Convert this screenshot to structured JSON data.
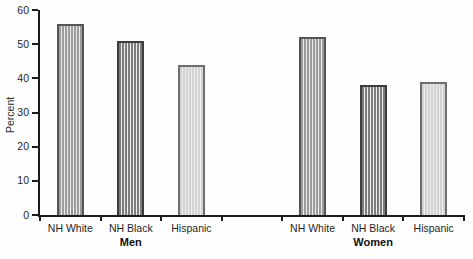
{
  "chart_data": {
    "type": "bar",
    "title": "",
    "ylabel": "Percent",
    "ylim": [
      0,
      60
    ],
    "yticks": [
      0,
      10,
      20,
      30,
      40,
      50,
      60
    ],
    "grid": false,
    "legend": "none",
    "groups": [
      {
        "label": "Men",
        "categories": [
          "NH White",
          "NH Black",
          "Hispanic"
        ],
        "values": [
          56,
          51,
          44
        ]
      },
      {
        "label": "Women",
        "categories": [
          "NH White",
          "NH Black",
          "Hispanic"
        ],
        "values": [
          52,
          38,
          39
        ]
      }
    ],
    "category_styles": [
      {
        "category": "NH White",
        "fill": "#9c9c9c",
        "border": "#555555"
      },
      {
        "category": "NH Black",
        "fill": "#7d7d7d",
        "border": "#3d3d3d"
      },
      {
        "category": "Hispanic",
        "fill": "#d3d3d3",
        "border": "#6e6e6e"
      }
    ],
    "axis_color": "#1b1b1b"
  }
}
